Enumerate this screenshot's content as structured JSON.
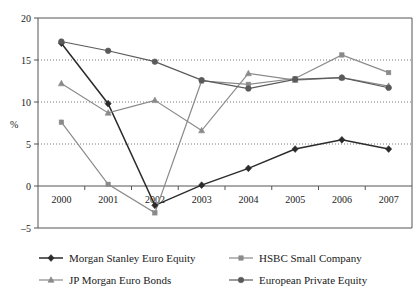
{
  "chart_data": {
    "type": "line",
    "title": "",
    "xlabel": "",
    "ylabel": "%",
    "categories": [
      "2000",
      "2001",
      "2002",
      "2003",
      "2004",
      "2005",
      "2006",
      "2007"
    ],
    "yticks": [
      "20",
      "15",
      "10",
      "5",
      "0",
      "-5"
    ],
    "ylim": [
      -5,
      20
    ],
    "grid": "horizontal-dotted",
    "zero_line": true,
    "legend_position": "bottom",
    "series": [
      {
        "name": "Morgan Stanley Euro Equity",
        "marker": "diamond",
        "color": "#2b2b2b",
        "values": [
          17.0,
          9.8,
          -2.3,
          0.1,
          2.1,
          4.4,
          5.5,
          4.4
        ]
      },
      {
        "name": "HSBC Small Company",
        "marker": "square",
        "color": "#8a8a8a",
        "values": [
          7.6,
          0.2,
          -3.2,
          12.5,
          12.1,
          12.8,
          15.6,
          13.5
        ]
      },
      {
        "name": "JP Morgan Euro Bonds",
        "marker": "triangle",
        "color": "#8a8a8a",
        "values": [
          12.2,
          8.7,
          10.2,
          6.6,
          13.4,
          12.6,
          12.9,
          11.9
        ]
      },
      {
        "name": "European Private Equity",
        "marker": "circle",
        "color": "#5a5a5a",
        "values": [
          17.2,
          16.1,
          14.8,
          12.6,
          11.6,
          12.7,
          12.9,
          11.7
        ]
      }
    ]
  }
}
